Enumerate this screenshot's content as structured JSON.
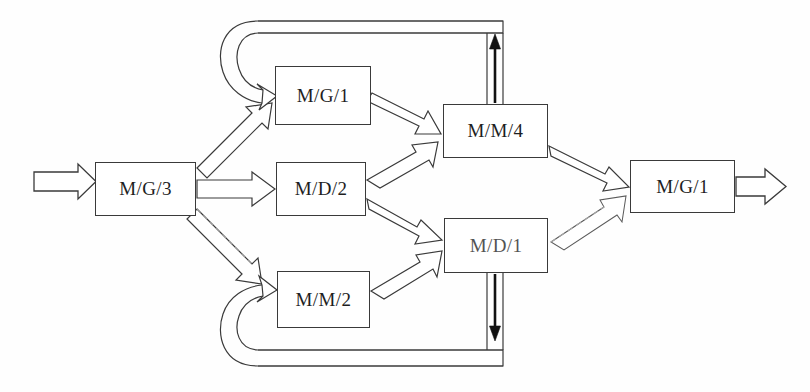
{
  "diagram": {
    "type": "queueing-network",
    "canvas": {
      "width": 810,
      "height": 392
    },
    "style": {
      "background": "#fefefe",
      "line_color": "#3a3a3a",
      "text_color": "#1e1e1e",
      "solid_arrow_color": "#111111"
    },
    "nodes": [
      {
        "id": "mg3",
        "label": "M/G/3",
        "x": 95,
        "y": 162,
        "w": 101,
        "h": 54,
        "faded": false
      },
      {
        "id": "mg1a",
        "label": "M/G/1",
        "x": 275,
        "y": 66,
        "w": 96,
        "h": 59,
        "faded": false
      },
      {
        "id": "md2",
        "label": "M/D/2",
        "x": 276,
        "y": 162,
        "w": 90,
        "h": 54,
        "faded": false
      },
      {
        "id": "mm2",
        "label": "M/M/2",
        "x": 277,
        "y": 271,
        "w": 93,
        "h": 57,
        "faded": false
      },
      {
        "id": "mm4",
        "label": "M/M/4",
        "x": 443,
        "y": 104,
        "w": 105,
        "h": 54,
        "faded": false
      },
      {
        "id": "md1",
        "label": "M/D/1",
        "x": 444,
        "y": 218,
        "w": 104,
        "h": 55,
        "faded": true
      },
      {
        "id": "mg1b",
        "label": "M/G/1",
        "x": 630,
        "y": 160,
        "w": 105,
        "h": 53,
        "faded": false
      }
    ],
    "flows": [
      {
        "id": "arrival",
        "name": "external-arrival-arrow",
        "from": "external",
        "to": "mg3",
        "style": "hollow-block"
      },
      {
        "id": "mg3-mg1a",
        "name": "mg3-to-mg1-top-arrow",
        "from": "mg3",
        "to": "mg1a",
        "style": "hollow-block"
      },
      {
        "id": "mg3-md2",
        "name": "mg3-to-md2-arrow",
        "from": "mg3",
        "to": "md2",
        "style": "hollow-block"
      },
      {
        "id": "mg3-mm2",
        "name": "mg3-to-mm2-arrow",
        "from": "mg3",
        "to": "mm2",
        "style": "hollow-block"
      },
      {
        "id": "mg1a-mm4",
        "name": "mg1-top-to-mm4-arrow",
        "from": "mg1a",
        "to": "mm4",
        "style": "hollow-block"
      },
      {
        "id": "md2-mm4",
        "name": "md2-to-mm4-arrow",
        "from": "md2",
        "to": "mm4",
        "style": "hollow-block"
      },
      {
        "id": "md2-md1",
        "name": "md2-to-md1-arrow",
        "from": "md2",
        "to": "md1",
        "style": "hollow-block"
      },
      {
        "id": "mm2-md1",
        "name": "mm2-to-md1-arrow",
        "from": "mm2",
        "to": "md1",
        "style": "hollow-block"
      },
      {
        "id": "mm4-mg1b",
        "name": "mm4-to-mg1-right-arrow",
        "from": "mm4",
        "to": "mg1b",
        "style": "hollow-block"
      },
      {
        "id": "md1-mg1b",
        "name": "md1-to-mg1-right-arrow",
        "from": "md1",
        "to": "mg1b",
        "style": "hollow-block-faded"
      },
      {
        "id": "departure",
        "name": "external-departure-arrow",
        "from": "mg1b",
        "to": "external",
        "style": "hollow-block"
      }
    ],
    "feedback_loops": [
      {
        "id": "top-loop",
        "name": "mm4-to-mg1-top-feedback-loop",
        "from": "mm4",
        "to": "mg1a",
        "riser_direction": "up",
        "band_y": 21,
        "band_height": 12,
        "riser_x": 487
      },
      {
        "id": "bottom-loop",
        "name": "md1-to-mm2-bottom-feedback-loop",
        "from": "md1",
        "to": "mm2",
        "riser_direction": "down",
        "band_y": 350,
        "band_height": 16,
        "riser_x": 487
      }
    ]
  }
}
